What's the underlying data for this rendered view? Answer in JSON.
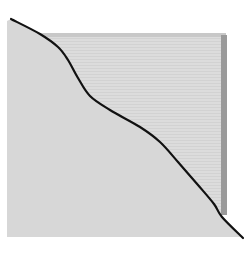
{
  "figure": {
    "type": "schematic-curve-diagram",
    "width": 249,
    "height": 257,
    "colors": {
      "background": "#ffffff",
      "back_panel": "#dcdcdc",
      "back_panel_stripe": "#d2d2d2",
      "back_panel_top_edge": "#c8c8c8",
      "back_panel_side_shadow": "#9a9a9a",
      "front_region": "#d7d7d7",
      "curve": "#111111"
    },
    "back_panel": {
      "x": 40,
      "y": 33,
      "width": 186,
      "height": 182
    },
    "front_region_bounds": {
      "left": 7,
      "bottom": 237
    },
    "curve_points": [
      [
        11,
        19
      ],
      [
        40,
        34
      ],
      [
        58,
        47
      ],
      [
        68,
        60
      ],
      [
        78,
        78
      ],
      [
        90,
        96
      ],
      [
        110,
        110
      ],
      [
        140,
        127
      ],
      [
        160,
        142
      ],
      [
        178,
        162
      ],
      [
        198,
        185
      ],
      [
        214,
        204
      ],
      [
        222,
        217
      ],
      [
        243,
        238
      ]
    ]
  }
}
